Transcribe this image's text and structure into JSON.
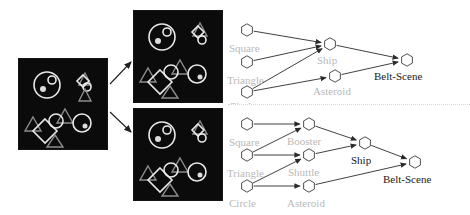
{
  "figure": {
    "title": "",
    "panels": {
      "input": {
        "name": "input-scene",
        "caption": ""
      },
      "top": {
        "name": "parse-top",
        "caption": ""
      },
      "bottom": {
        "name": "parse-bottom",
        "caption": ""
      }
    }
  },
  "colors": {
    "panel_background": "#0b0b0b",
    "shape_stroke": "#e9e9e9",
    "label_gray": "#b9b9b9",
    "label_dark": "#1a1a1a",
    "edge": "#2b2b2b",
    "page_background": "#ffffff"
  },
  "graphs": [
    {
      "id": "top",
      "nodes": [
        {
          "id": "t-square",
          "label": "Square",
          "label_style": "gray",
          "x": 22,
          "y": 30,
          "label_x": 4,
          "label_y": 52
        },
        {
          "id": "t-triangle",
          "label": "Triangle",
          "label_style": "gray",
          "x": 22,
          "y": 62,
          "label_x": 2,
          "label_y": 84
        },
        {
          "id": "t-circle",
          "label": "Circle",
          "label_style": "gray",
          "x": 22,
          "y": 92,
          "label_x": 4,
          "label_y": 110
        },
        {
          "id": "t-ship",
          "label": "Ship",
          "label_style": "gray",
          "x": 105,
          "y": 44,
          "label_x": 92,
          "label_y": 64
        },
        {
          "id": "t-asteroid",
          "label": "Asteroid",
          "label_style": "gray",
          "x": 110,
          "y": 76,
          "label_x": 88,
          "label_y": 95
        },
        {
          "id": "t-belt",
          "label": "Belt-Scene",
          "label_style": "dark",
          "x": 182,
          "y": 60,
          "label_x": 149,
          "label_y": 80
        }
      ],
      "edges": [
        {
          "from": "t-square",
          "to": "t-ship"
        },
        {
          "from": "t-triangle",
          "to": "t-ship"
        },
        {
          "from": "t-circle",
          "to": "t-ship"
        },
        {
          "from": "t-circle",
          "to": "t-asteroid"
        },
        {
          "from": "t-ship",
          "to": "t-belt"
        },
        {
          "from": "t-asteroid",
          "to": "t-belt"
        }
      ]
    },
    {
      "id": "bottom",
      "nodes": [
        {
          "id": "b-square",
          "label": "Square",
          "label_style": "gray",
          "x": 22,
          "y": 17,
          "label_x": 4,
          "label_y": 39
        },
        {
          "id": "b-triangle",
          "label": "Triangle",
          "label_style": "gray",
          "x": 22,
          "y": 48,
          "label_x": 2,
          "label_y": 70
        },
        {
          "id": "b-circle",
          "label": "Circle",
          "label_style": "gray",
          "x": 22,
          "y": 79,
          "label_x": 4,
          "label_y": 100
        },
        {
          "id": "b-booster",
          "label": "Booster",
          "label_style": "gray",
          "x": 84,
          "y": 17,
          "label_x": 62,
          "label_y": 38
        },
        {
          "id": "b-shuttle",
          "label": "Shuttle",
          "label_style": "gray",
          "x": 84,
          "y": 48,
          "label_x": 63,
          "label_y": 69
        },
        {
          "id": "b-asteroid",
          "label": "Asteroid",
          "label_style": "gray",
          "x": 84,
          "y": 79,
          "label_x": 62,
          "label_y": 100
        },
        {
          "id": "b-ship",
          "label": "Ship",
          "label_style": "dark",
          "x": 140,
          "y": 36,
          "label_x": 126,
          "label_y": 57
        },
        {
          "id": "b-belt",
          "label": "Belt-Scene",
          "label_style": "dark",
          "x": 190,
          "y": 55,
          "label_x": 158,
          "label_y": 76
        }
      ],
      "edges": [
        {
          "from": "b-square",
          "to": "b-booster"
        },
        {
          "from": "b-triangle",
          "to": "b-shuttle"
        },
        {
          "from": "b-circle",
          "to": "b-asteroid"
        },
        {
          "from": "b-triangle",
          "to": "b-booster"
        },
        {
          "from": "b-circle",
          "to": "b-shuttle"
        },
        {
          "from": "b-booster",
          "to": "b-ship"
        },
        {
          "from": "b-shuttle",
          "to": "b-ship"
        },
        {
          "from": "b-ship",
          "to": "b-belt"
        },
        {
          "from": "b-asteroid",
          "to": "b-belt"
        }
      ]
    }
  ],
  "flow_arrows": [
    {
      "name": "arrow-to-top-panel",
      "x1": 110,
      "y1": 84,
      "x2": 131,
      "y2": 62
    },
    {
      "name": "arrow-to-bottom-panel",
      "x1": 110,
      "y1": 112,
      "x2": 131,
      "y2": 132
    }
  ],
  "scene_shapes": {
    "big_circle": {
      "cx": 28,
      "cy": 26,
      "r": 13
    },
    "inner_circle": {
      "cx": 33,
      "cy": 22,
      "r": 4
    },
    "inner_dot": {
      "cx": 25,
      "cy": 30,
      "r": 3
    },
    "mid_circle": {
      "cx": 35,
      "cy": 62,
      "r": 7
    },
    "right_circle": {
      "cx": 62,
      "cy": 65,
      "r": 8
    },
    "diamond": {
      "cx": 26,
      "cy": 72,
      "r": 11
    },
    "top_right_diamond": {
      "cx": 66,
      "cy": 22,
      "r": 7
    },
    "top_right_circle": {
      "cx": 70,
      "cy": 30,
      "r": 4
    }
  }
}
